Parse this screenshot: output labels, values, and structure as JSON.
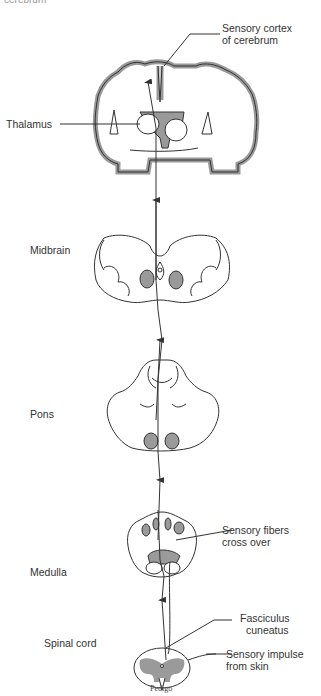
{
  "diagram": {
    "title_clipped": "cerebrum",
    "labels": {
      "sensory_cortex": [
        "Sensory cortex",
        "of cerebrum"
      ],
      "thalamus": "Thalamus",
      "midbrain": "Midbrain",
      "pons": "Pons",
      "medulla": "Medulla",
      "sensory_fibers": [
        "Sensory fibers",
        "cross over"
      ],
      "spinal_cord": "Spinal cord",
      "fasciculus": [
        "Fasciculus",
        "cuneatus"
      ],
      "sensory_impulse": [
        "Sensory impulse",
        "from skin"
      ]
    },
    "signature": "Pedigo",
    "colors": {
      "shade": "#9a9a9a",
      "line": "#333333",
      "background": "#ffffff"
    }
  }
}
